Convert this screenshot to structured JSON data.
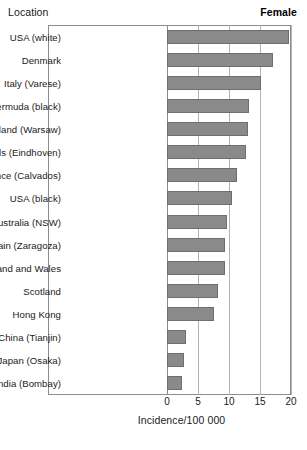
{
  "header": {
    "left_label": "Location",
    "right_label": "Female"
  },
  "chart_data": {
    "type": "bar",
    "orientation": "horizontal",
    "title": "",
    "xlabel": "Incidence/100 000",
    "ylabel": "Location",
    "series_name": "Female",
    "xlim": [
      0,
      20
    ],
    "xticks": [
      0,
      5,
      10,
      15,
      20
    ],
    "grid": true,
    "legend": "none",
    "bar_color": "#8a8a8a",
    "bar_edge_color": "#6e6e6e",
    "categories": [
      "USA (white)",
      "Denmark",
      "Italy (Varese)",
      "Bermuda (black)",
      "Poland (Warsaw)",
      "Netherlands (Eindhoven)",
      "France (Calvados)",
      "USA (black)",
      "Australia (NSW)",
      "Spain (Zaragoza)",
      "England and Wales",
      "Scotland",
      "Hong Kong",
      "China (Tianjin)",
      "Japan (Osaka)",
      "India (Bombay)"
    ],
    "values": [
      19.6,
      17.1,
      15.2,
      13.3,
      13.0,
      12.8,
      11.3,
      10.5,
      9.7,
      9.4,
      9.3,
      8.3,
      7.6,
      3.1,
      2.8,
      2.4
    ]
  }
}
